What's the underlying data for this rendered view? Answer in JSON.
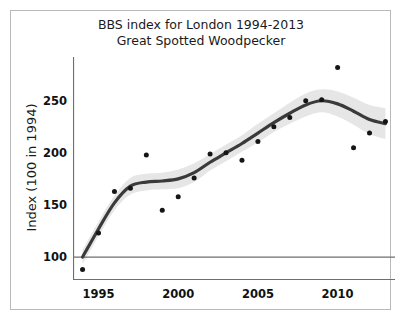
{
  "figure": {
    "title_line1": "BBS index for London 1994-2013",
    "title_line2": "Great Spotted Woodpecker",
    "bottom_fragment": ""
  },
  "chart_data": {
    "type": "scatter",
    "title": "BBS index for London 1994-2013 Great Spotted Woodpecker",
    "subtitle": "Great Spotted Woodpecker",
    "xlabel": "",
    "ylabel": "Index (100 in 1994)",
    "xlim": [
      1993.4,
      2013.6
    ],
    "ylim": [
      78,
      292
    ],
    "grid": false,
    "legend": false,
    "x": [
      1994,
      1995,
      1996,
      1997,
      1998,
      1999,
      2000,
      2001,
      2002,
      2003,
      2004,
      2005,
      2006,
      2007,
      2008,
      2009,
      2010,
      2011,
      2012,
      2013
    ],
    "values": [
      88,
      123,
      163,
      166,
      198,
      145,
      158,
      176,
      199,
      200,
      193,
      211,
      225,
      234,
      250,
      251,
      282,
      205,
      219,
      230
    ],
    "series": [
      {
        "name": "Annual index",
        "values": [
          88,
          123,
          163,
          166,
          198,
          145,
          158,
          176,
          199,
          200,
          193,
          211,
          225,
          234,
          250,
          251,
          282,
          205,
          219,
          230
        ]
      },
      {
        "name": "Smoothed trend",
        "values": [
          100,
          127,
          152,
          168,
          172,
          173,
          175,
          181,
          191,
          200,
          209,
          219,
          229,
          238,
          246,
          250,
          247,
          240,
          232,
          228
        ]
      },
      {
        "name": "Confidence band upper",
        "values": [
          107,
          134,
          159,
          176,
          180,
          181,
          184,
          190,
          199,
          208,
          217,
          228,
          238,
          248,
          257,
          261,
          259,
          253,
          246,
          243
        ]
      },
      {
        "name": "Confidence band lower",
        "values": [
          93,
          120,
          145,
          160,
          164,
          165,
          166,
          172,
          183,
          192,
          201,
          210,
          220,
          228,
          235,
          239,
          235,
          227,
          218,
          213
        ]
      }
    ],
    "reference_line": {
      "y": 100,
      "label": "100"
    },
    "yticks": [
      100,
      150,
      200,
      250
    ],
    "ytick_labels": [
      "100",
      "150",
      "200",
      "250"
    ],
    "xticks": [
      1995,
      2000,
      2005,
      2010
    ],
    "xtick_labels": [
      "1995",
      "2000",
      "2005",
      "2010"
    ],
    "colors": {
      "point": "#151515",
      "trend_line": "#3a3a3a",
      "confidence_band": "#e6e6e6",
      "reference_line": "#6e6e6e",
      "axis": "#6e6e6e",
      "text": "#111111",
      "frame": "#b9b9b9"
    }
  }
}
